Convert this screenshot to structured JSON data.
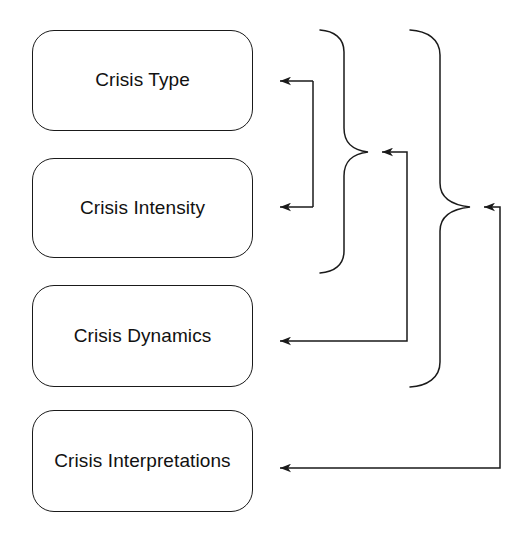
{
  "diagram": {
    "type": "flow-diagram",
    "background_color": "#ffffff",
    "stroke_color": "#1a1a1a",
    "text_color": "#111111",
    "nodes": [
      {
        "id": "crisis-type",
        "label": "Crisis Type",
        "shape": "rounded-rectangle",
        "x": 32,
        "y": 30,
        "width": 221,
        "height": 101
      },
      {
        "id": "crisis-intensity",
        "label": "Crisis Intensity",
        "shape": "rounded-rectangle",
        "x": 32,
        "y": 158,
        "width": 221,
        "height": 100
      },
      {
        "id": "crisis-dynamics",
        "label": "Crisis Dynamics",
        "shape": "rounded-rectangle",
        "x": 32,
        "y": 285,
        "width": 221,
        "height": 102
      },
      {
        "id": "crisis-interpretations",
        "label": "Crisis Interpretations",
        "shape": "rounded-rectangle",
        "x": 32,
        "y": 410,
        "width": 221,
        "height": 102
      }
    ],
    "connectors": [
      {
        "id": "brace-inner",
        "kind": "curly-brace",
        "groups": [
          "crisis-type",
          "crisis-intensity"
        ],
        "tip_x": 368,
        "tip_y": 152,
        "top_y": 30,
        "bottom_y": 273
      },
      {
        "id": "brace-outer",
        "kind": "curly-brace",
        "groups": [
          "crisis-type",
          "crisis-intensity",
          "crisis-dynamics"
        ],
        "tip_x": 470,
        "tip_y": 207,
        "top_y": 30,
        "bottom_y": 387
      },
      {
        "id": "fork-to-type-and-intensity",
        "kind": "double-arrow-bracket",
        "from": "brace-inner-source",
        "to": [
          "crisis-type",
          "crisis-intensity"
        ],
        "arrow_y_top": 81,
        "arrow_y_bottom": 207,
        "corner_x": 313,
        "arrow_tip_x": 272
      },
      {
        "id": "arrow-to-dynamics",
        "kind": "elbow-arrow",
        "from": "brace-inner",
        "to": "crisis-dynamics",
        "arrow_y": 341,
        "corner_x": 407,
        "arrow_tip_x": 272
      },
      {
        "id": "arrow-to-interpretations",
        "kind": "elbow-arrow",
        "from": "brace-outer",
        "to": "crisis-interpretations",
        "arrow_y": 468,
        "corner_x": 500,
        "arrow_tip_x": 272
      }
    ]
  }
}
